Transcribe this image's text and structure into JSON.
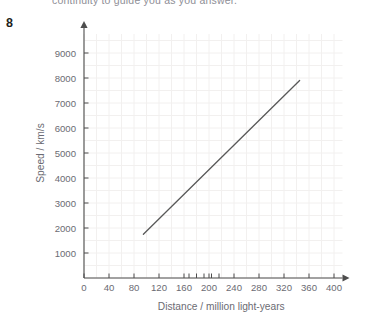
{
  "page": {
    "header_text": "continuity to guide you as you answer.",
    "question_number": "8"
  },
  "chart_data": {
    "type": "line",
    "title": "",
    "xlabel": "Distance / million light-years",
    "ylabel": "Speed / km/s",
    "xlim": [
      0,
      420
    ],
    "ylim": [
      0,
      9600
    ],
    "xticks": [
      0,
      40,
      80,
      120,
      160,
      200,
      240,
      280,
      320,
      360,
      400
    ],
    "yticks": [
      1000,
      2000,
      3000,
      4000,
      5000,
      6000,
      7000,
      8000,
      9000
    ],
    "xtick_labels": [
      "0",
      "40",
      "80",
      "120",
      "160",
      "200",
      "240",
      "280",
      "320",
      "360",
      "400"
    ],
    "ytick_labels": [
      "1000",
      "2000",
      "3000",
      "4000",
      "5000",
      "6000",
      "7000",
      "8000",
      "9000"
    ],
    "minor_xticks": [
      168,
      180,
      192,
      204,
      216
    ],
    "grid": true,
    "legend": "none",
    "series": [
      {
        "name": "line-of-best-fit",
        "x": [
          95,
          345
        ],
        "y": [
          1750,
          7900
        ],
        "color": "#595959"
      }
    ]
  },
  "colors": {
    "axis": "#4d4d4d",
    "grid": "#f2f0ef",
    "line": "#595959",
    "text": "#6b6b73",
    "question_number": "#231f20"
  }
}
